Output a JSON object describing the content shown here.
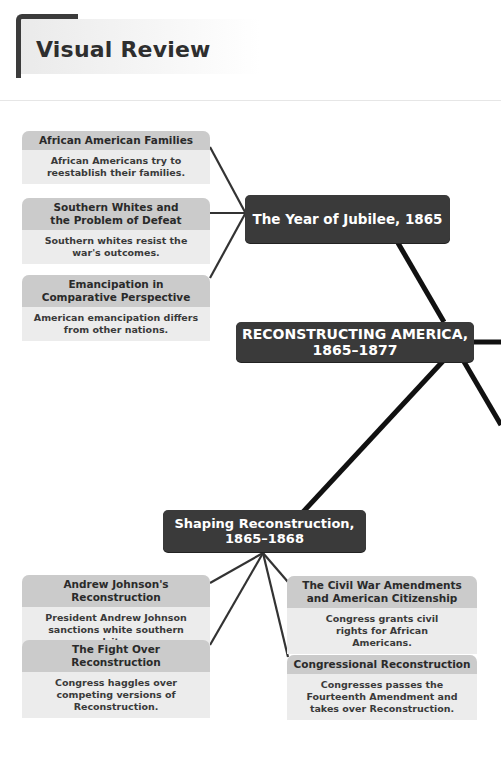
{
  "page": {
    "title": "Visual Review"
  },
  "diagram": {
    "center": {
      "label": "RECONSTRUCTING AMERICA, 1865–1877",
      "line1": "RECONSTRUCTING AMERICA,",
      "line2": "1865–1877"
    },
    "branches": [
      {
        "label": "The Year of Jubilee, 1865",
        "topics": [
          {
            "heading": "African American Families",
            "summary": "African Americans try to reestablish their families."
          },
          {
            "heading": "Southern Whites and the Problem of Defeat",
            "summary": "Southern whites resist the war's outcomes."
          },
          {
            "heading": "Emancipation in Comparative Perspective",
            "summary": "American emancipation differs from other nations."
          }
        ]
      },
      {
        "label": "Shaping Reconstruction, 1865–1868",
        "line1": "Shaping Reconstruction,",
        "line2": "1865–1868",
        "topics": [
          {
            "heading": "Andrew Johnson's Reconstruction",
            "summary": "President Andrew Johnson sanctions white southern recalcitrance."
          },
          {
            "heading": "The Fight Over Reconstruction",
            "summary": "Congress haggles over competing versions of Reconstruction."
          },
          {
            "heading": "The Civil War Amendments and American Citizenship",
            "summary": "Congress grants civil rights for African Americans."
          },
          {
            "heading": "Congressional Reconstruction",
            "summary": "Congresses passes the Fourteenth Amendment and takes over Reconstruction."
          }
        ]
      }
    ],
    "colors": {
      "node": "#3a3a3a",
      "card_head": "#cbcbcb",
      "card_body": "#ececec",
      "line": "#111111"
    }
  }
}
